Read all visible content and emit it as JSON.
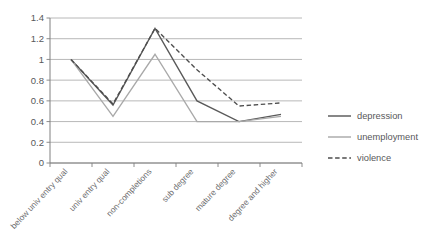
{
  "chart_data": {
    "type": "line",
    "title": "",
    "subtitle": "",
    "xlabel": "",
    "ylabel": "",
    "categories": [
      "below univ entry qual",
      "univ entry qual",
      "non-completions",
      "sub degree",
      "mature degree",
      "degree and higher"
    ],
    "series": [
      {
        "name": "depression",
        "values": [
          1.0,
          0.56,
          1.3,
          0.6,
          0.4,
          0.47
        ],
        "color": "#595959",
        "style": "solid"
      },
      {
        "name": "unemployment",
        "values": [
          1.0,
          0.45,
          1.05,
          0.4,
          0.4,
          0.45
        ],
        "color": "#a9a9a9",
        "style": "solid"
      },
      {
        "name": "violence",
        "values": [
          1.0,
          0.57,
          1.3,
          0.9,
          0.55,
          0.58
        ],
        "color": "#4d4d4d",
        "style": "dashed"
      }
    ],
    "ylim": [
      0,
      1.4
    ],
    "yticks": [
      0,
      0.2,
      0.4,
      0.6,
      0.8,
      1,
      1.2,
      1.4
    ],
    "ytick_labels": [
      "0",
      "0.2",
      "0.4",
      "0.6",
      "0.8",
      "1",
      "1.2",
      "1.4"
    ],
    "grid": "horizontal",
    "legend_position": "right",
    "gridline_color": "#b0b0b0",
    "axis_color": "#808080",
    "background": "#ffffff"
  },
  "legend": {
    "items": [
      {
        "label": "depression"
      },
      {
        "label": "unemployment"
      },
      {
        "label": "violence"
      }
    ]
  }
}
